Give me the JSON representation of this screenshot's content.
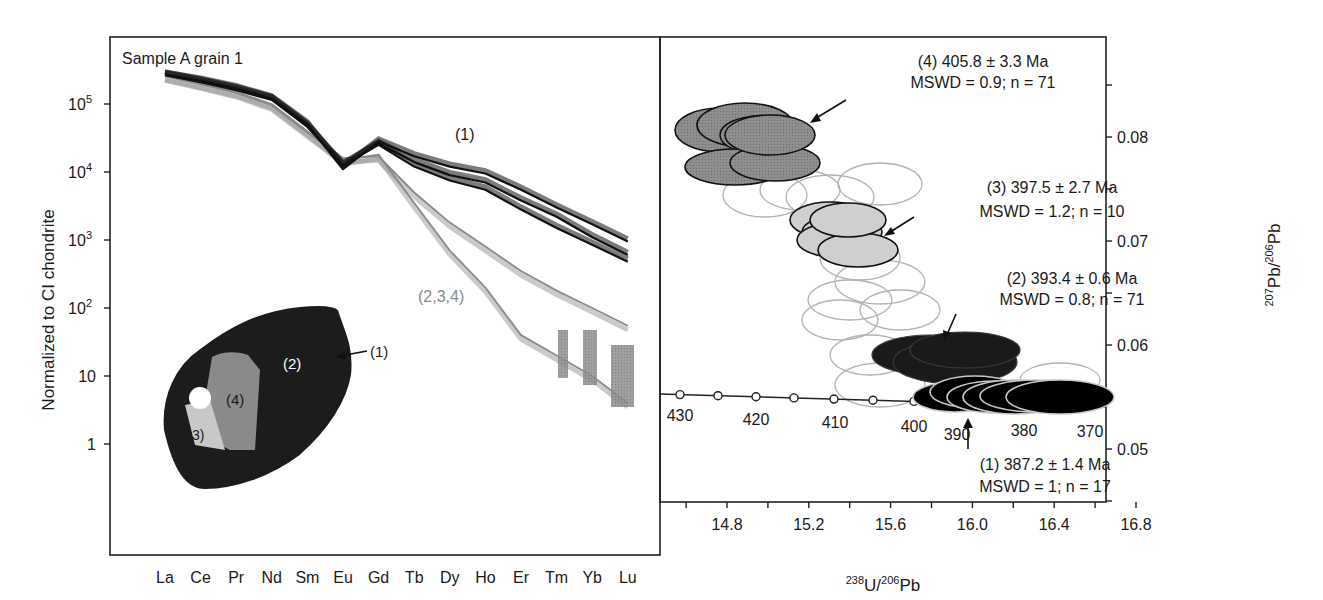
{
  "chart_data": [
    {
      "type": "line",
      "title": "Sample A grain 1",
      "xlabel": "",
      "ylabel": "Normalized to CI chondrite",
      "yscale": "log",
      "ylim": [
        0.3,
        600000
      ],
      "categories": [
        "La",
        "Ce",
        "Pr",
        "Nd",
        "Sm",
        "Eu",
        "Gd",
        "Tb",
        "Dy",
        "Ho",
        "Er",
        "Tm",
        "Yb",
        "Lu"
      ],
      "yticks": [
        {
          "value": 100000,
          "base": "10",
          "exp": "5"
        },
        {
          "value": 10000,
          "base": "10",
          "exp": "4"
        },
        {
          "value": 1000,
          "base": "10",
          "exp": "3"
        },
        {
          "value": 100,
          "base": "10",
          "exp": "2"
        },
        {
          "value": 10,
          "base": "10",
          "exp": ""
        },
        {
          "value": 1,
          "base": "1",
          "exp": ""
        }
      ],
      "series": [
        {
          "name": "(1) rim",
          "color": "#111111",
          "values": [
            270000,
            220000,
            170000,
            120000,
            50000,
            11000,
            28000,
            17000,
            12000,
            9500,
            5500,
            3000,
            1700,
            950
          ]
        },
        {
          "name": "(1) rim variant",
          "color": "#111111",
          "values": [
            270000,
            215000,
            165000,
            118000,
            48000,
            12000,
            26000,
            14000,
            9000,
            7000,
            3800,
            2200,
            1100,
            600
          ]
        },
        {
          "name": "(1) rim variant low",
          "color": "#111111",
          "values": [
            265000,
            210000,
            160000,
            115000,
            46000,
            12500,
            25000,
            12000,
            7500,
            5500,
            2800,
            1500,
            850,
            480
          ]
        },
        {
          "name": "(2,3,4) core",
          "color": "#8a8a8a",
          "values": [
            260000,
            200000,
            150000,
            100000,
            40000,
            15000,
            18000,
            3500,
            700,
            200,
            40,
            20,
            10,
            4
          ]
        },
        {
          "name": "(2,3,4) core variant",
          "color": "#8a8a8a",
          "values": [
            255000,
            195000,
            145000,
            95000,
            38000,
            16000,
            17000,
            5000,
            1800,
            800,
            350,
            180,
            100,
            55
          ]
        }
      ],
      "annotations": [
        {
          "text": "(1)",
          "near": "upper HREE curves (black)"
        },
        {
          "text": "(2,3,4)",
          "near": "lower HREE curves (gray)"
        }
      ],
      "inset": {
        "description": "CL image of zircon grain with zones",
        "zones": [
          "(1)",
          "(2)",
          "(3)",
          "(4)"
        ]
      }
    },
    {
      "type": "scatter",
      "subtype": "Tera-Wasserburg concordia with error ellipses",
      "xlabel": "238U/206Pb",
      "ylabel": "207Pb/206Pb",
      "xlim": [
        14.4,
        17.0
      ],
      "ylim": [
        0.045,
        0.09
      ],
      "xticks": [
        "14.8",
        "15.2",
        "15.6",
        "16.0",
        "16.4",
        "16.8"
      ],
      "yticks": [
        "0.08",
        "0.07",
        "0.06",
        "0.05"
      ],
      "concordia_ages": [
        "430",
        "420",
        "410",
        "400",
        "390",
        "380",
        "370"
      ],
      "groups": [
        {
          "label": "(4) 405.8 ± 3.3 Ma",
          "stats": "MSWD = 0.9; n = 71",
          "fill": "#6b6b6b",
          "center": [
            14.85,
            0.0795
          ]
        },
        {
          "label": "(3) 397.5 ± 2.7 Ma",
          "stats": "MSWD = 1.2; n = 10",
          "fill": "#c8c8c8",
          "center": [
            15.35,
            0.0705
          ]
        },
        {
          "label": "(2) 393.4 ± 0.6 Ma",
          "stats": "MSWD = 0.8; n = 71",
          "fill": "#1e1e1e",
          "center": [
            15.95,
            0.059
          ]
        },
        {
          "label": "(1) 387.2 ± 1.4 Ma",
          "stats": "MSWD = 1; n = 17",
          "fill": "#000000",
          "center": [
            16.25,
            0.0555
          ]
        }
      ]
    }
  ],
  "left_panel": {
    "title": "Sample A grain 1",
    "ylabel": "Normalized to CI chondrite",
    "label_rim": "(1)",
    "label_core": "(2,3,4)",
    "inset_labels": {
      "z1": "(1)",
      "z2": "(2)",
      "z3": "3)",
      "z4": "(4)"
    }
  },
  "right_panel": {
    "xlabel_iso1": "238",
    "xlabel_el1": "U/",
    "xlabel_iso2": "206",
    "xlabel_el2": "Pb",
    "ylabel_iso1": "207",
    "ylabel_el1": "Pb/",
    "ylabel_iso2": "206",
    "ylabel_el2": "Pb",
    "g4_line1": "(4) 405.8 ± 3.3 Ma",
    "g4_line2": "MSWD = 0.9; n = 71",
    "g3_line1": "(3) 397.5 ± 2.7 Ma",
    "g3_line2": "MSWD = 1.2; n = 10",
    "g2_line1": "(2) 393.4 ± 0.6 Ma",
    "g2_line2": "MSWD = 0.8; n = 71",
    "g1_line1": "(1) 387.2 ± 1.4 Ma",
    "g1_line2": "MSWD = 1; n = 17"
  }
}
